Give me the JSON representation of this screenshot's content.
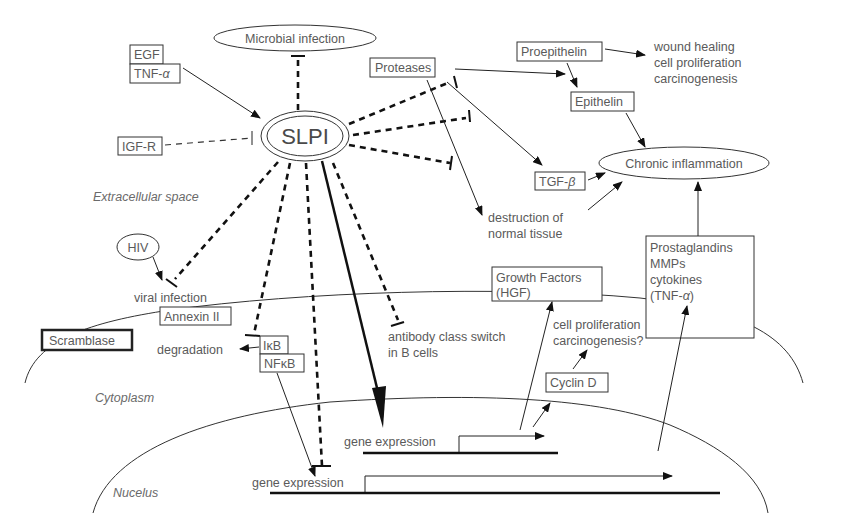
{
  "center": {
    "label": "SLPI"
  },
  "nodes": {
    "microbial_infection": "Microbial infection",
    "egf": "EGF",
    "tnf_alpha_top": "TNF-",
    "alpha": "α",
    "beta": "β",
    "igf_r": "IGF-R",
    "proteases": "Proteases",
    "proepithelin": "Proepithelin",
    "epithelin": "Epithelin",
    "tgf_beta": "TGF-",
    "chronic_inflammation": "Chronic inflammation",
    "wound_effects": [
      "wound healing",
      "cell proliferation",
      "carcinogenesis"
    ],
    "destruction": [
      "destruction of",
      "normal tissue"
    ],
    "prostaglandins": [
      "Prostaglandins",
      "MMPs",
      "cytokines",
      "(TNF-"
    ],
    "prostaglandins_close": ")",
    "hiv": "HIV",
    "viral_infection": "viral infection",
    "annexin": "Annexin II",
    "scramblase": "Scramblase",
    "degradation": "degradation",
    "ikb": "IκB",
    "nfkb": "NFκB",
    "antibody": [
      "antibody class switch",
      "in B cells"
    ],
    "growth_factors": [
      "Growth Factors",
      "(HGF)"
    ],
    "cell_prolif2": [
      "cell proliferation",
      "carcinogenesis?"
    ],
    "cyclin_d": "Cyclin D",
    "gene_expression_1": "gene expression",
    "gene_expression_2": "gene expression"
  },
  "regions": {
    "extracellular": "Extracellular space",
    "cytoplasm": "Cytoplasm",
    "nucleus": "Nucelus"
  }
}
